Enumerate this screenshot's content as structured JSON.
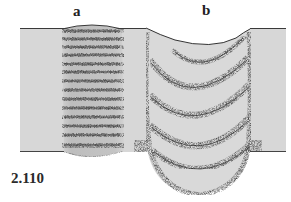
{
  "figure": {
    "number": "2.110",
    "panels": [
      {
        "id": "a",
        "label": "a",
        "description": "rectangular banded column"
      },
      {
        "id": "b",
        "label": "b",
        "description": "U-shaped nested crescent bands"
      }
    ],
    "colors": {
      "background": "#ffffff",
      "plate": "#d7d7d7",
      "ink": "#2b2b2b",
      "stipple": "#3a3a3a"
    },
    "panel_a_stripe_count": 14,
    "panel_b_band_count": 5
  }
}
